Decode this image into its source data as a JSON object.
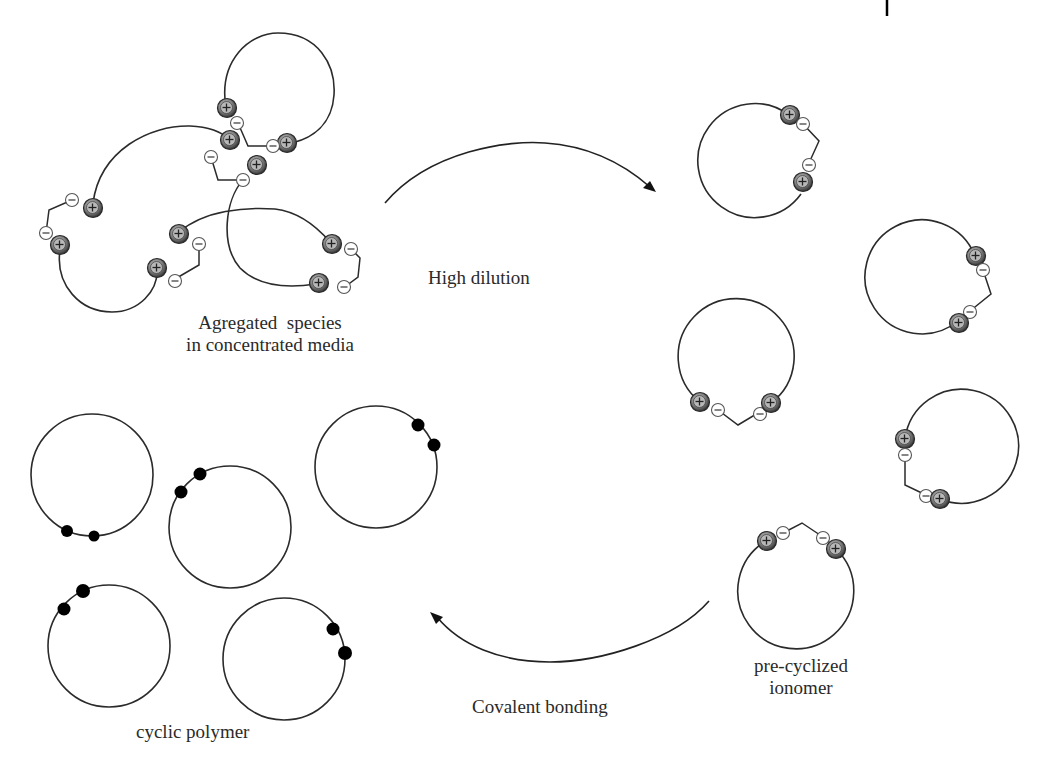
{
  "figure": {
    "labels": {
      "aggregated_line1": "Agregated  species",
      "aggregated_line2": "in concentrated media",
      "high_dilution": "High dilution",
      "precyclized_line1": "pre-cyclized",
      "precyclized_line2": "ionomer",
      "covalent_bonding": "Covalent bonding",
      "cyclic_polymer": "cyclic polymer"
    },
    "legend_symbols": {
      "cation": "plus-sphere",
      "anion": "minus-circle",
      "covalent_end": "black-dot"
    },
    "stages": [
      {
        "name": "aggregated",
        "description": "linear chains with ionic end groups associating"
      },
      {
        "name": "pre-cyclized",
        "count": 5
      },
      {
        "name": "cyclic",
        "count": 5
      }
    ],
    "colors": {
      "line": "#2b2b2b",
      "cation_fill": "#7a7a7a",
      "anion_fill": "#ffffff",
      "dot": "#000000",
      "background": "#ffffff"
    }
  }
}
